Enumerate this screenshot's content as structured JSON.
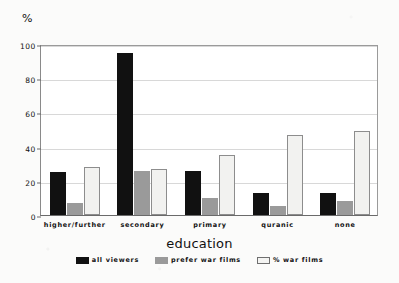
{
  "chart_data": {
    "type": "bar",
    "title": "",
    "xlabel": "education",
    "ylabel": "%",
    "ylim": [
      0,
      100
    ],
    "yticks": [
      0,
      20,
      40,
      60,
      80,
      100
    ],
    "grid": true,
    "legend_position": "bottom",
    "categories": [
      "higher/further",
      "secondary",
      "primary",
      "quranic",
      "none"
    ],
    "series": [
      {
        "name": "all viewers",
        "color": "#111111",
        "values": [
          25,
          95,
          26,
          13,
          13
        ]
      },
      {
        "name": "prefer war films",
        "color": "#9a9a9a",
        "values": [
          7,
          26,
          10,
          5,
          8
        ]
      },
      {
        "name": "% war films",
        "color": "#f2f2f0",
        "values": [
          28,
          27,
          35,
          47,
          49
        ]
      }
    ]
  },
  "axis": {
    "y_unit_label": "%",
    "y_tick_labels": [
      "0",
      "20",
      "40",
      "60",
      "80",
      "100"
    ],
    "x_title": "education",
    "x_tick_labels": [
      "higher/further",
      "secondary",
      "primary",
      "quranic",
      "none"
    ]
  },
  "legend": {
    "items": [
      {
        "label": "all viewers"
      },
      {
        "label": "prefer war films"
      },
      {
        "label": "% war films"
      }
    ]
  }
}
